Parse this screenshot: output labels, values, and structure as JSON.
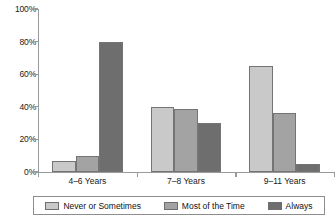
{
  "chart_data": {
    "type": "bar",
    "title": "",
    "xlabel": "",
    "ylabel": "",
    "ylim": [
      0,
      100
    ],
    "yticks": [
      "0%",
      "20%",
      "40%",
      "60%",
      "80%",
      "100%"
    ],
    "ytick_values": [
      0,
      20,
      40,
      60,
      80,
      100
    ],
    "grid": false,
    "legend_position": "bottom",
    "categories": [
      "4–6 Years",
      "7–8 Years",
      "9–11 Years"
    ],
    "series": [
      {
        "name": "Never or Sometimes",
        "color": "#c9c9c9",
        "values": [
          7,
          40,
          65
        ]
      },
      {
        "name": "Most of the Time",
        "color": "#a3a3a3",
        "values": [
          10,
          38.5,
          36
        ]
      },
      {
        "name": "Always",
        "color": "#6e6e6e",
        "values": [
          80,
          30,
          5
        ]
      }
    ]
  }
}
